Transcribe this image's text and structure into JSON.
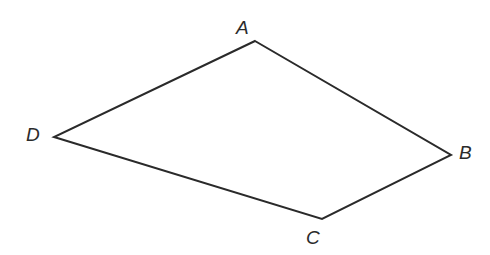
{
  "figure": {
    "kind": "quadrilateral-diagram",
    "name": "Quadrilateral ABCD",
    "canvas": {
      "width": 490,
      "height": 255
    },
    "background_color": "#ffffff",
    "stroke_color": "#2a2a2a",
    "stroke_width": 2,
    "fill": "none",
    "vertices": [
      {
        "label": "A",
        "x": 255,
        "y": 41,
        "label_x": 236,
        "label_y": 18,
        "label_position": "above-left"
      },
      {
        "label": "B",
        "x": 451,
        "y": 155,
        "label_x": 459,
        "label_y": 143,
        "label_position": "right"
      },
      {
        "label": "C",
        "x": 322,
        "y": 219,
        "label_x": 306,
        "label_y": 228,
        "label_position": "below-left"
      },
      {
        "label": "D",
        "x": 54,
        "y": 137,
        "label_x": 26,
        "label_y": 125,
        "label_position": "left"
      }
    ],
    "edges": [
      {
        "name": "AB",
        "from": "A",
        "to": "B"
      },
      {
        "name": "BC",
        "from": "B",
        "to": "C"
      },
      {
        "name": "CD",
        "from": "C",
        "to": "D"
      },
      {
        "name": "DA",
        "from": "D",
        "to": "A"
      }
    ],
    "polygon_points": "255,41 451,155 322,219 54,137"
  }
}
